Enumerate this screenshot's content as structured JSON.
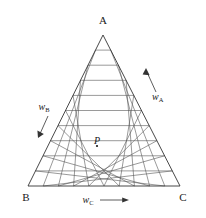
{
  "chart_data": {
    "type": "ternary-grid",
    "title": "",
    "subtitle": "",
    "divisions": 10,
    "grid": true,
    "background_color": "#ffffff",
    "line_color": "#555555",
    "outline_color": "#333333",
    "text_color": "#1a1a1a",
    "vertices": [
      {
        "id": "A",
        "label": "A",
        "position": "top",
        "x": 103.0,
        "y": 35.0
      },
      {
        "id": "B",
        "label": "B",
        "position": "bottom-left",
        "x": 28.0,
        "y": 186.0
      },
      {
        "id": "C",
        "label": "C",
        "position": "bottom-right",
        "x": 180.0,
        "y": 186.0
      }
    ],
    "vertex_labels": {
      "top": "A",
      "bottom_left": "B",
      "bottom_right": "C"
    },
    "axes": [
      {
        "id": "wA",
        "symbol": "w",
        "subscript": "A",
        "label": "wA",
        "edge": "right",
        "arrow_direction": "up-right",
        "description": "mass fraction of A increasing toward vertex A"
      },
      {
        "id": "wB",
        "symbol": "w",
        "subscript": "B",
        "label": "wB",
        "edge": "left",
        "arrow_direction": "down-left",
        "description": "mass fraction of B increasing toward vertex B"
      },
      {
        "id": "wC",
        "symbol": "w",
        "subscript": "C",
        "label": "wC",
        "edge": "bottom",
        "arrow_direction": "right",
        "description": "mass fraction of C increasing toward vertex C"
      }
    ],
    "points": [
      {
        "id": "P",
        "label": "P",
        "x": 97.0,
        "y": 146.0,
        "composition": {
          "wA": 0.3,
          "wB": 0.4,
          "wC": 0.3
        }
      }
    ],
    "xlabel": "wC",
    "ylabel": "",
    "legend": []
  }
}
